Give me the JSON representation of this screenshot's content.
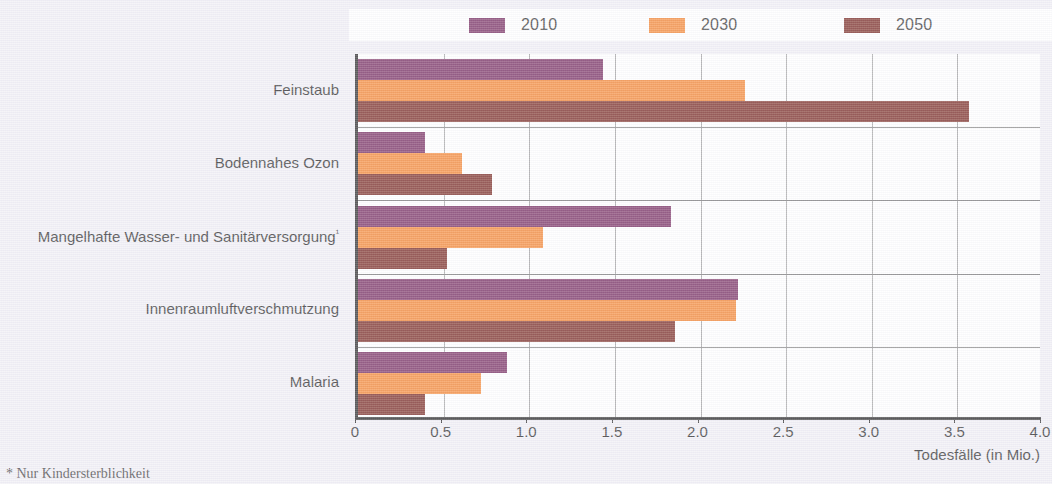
{
  "legend": {
    "items": [
      {
        "label": "2010",
        "color": "#6B1A52"
      },
      {
        "label": "2030",
        "color": "#F47B20"
      },
      {
        "label": "2050",
        "color": "#6E1810"
      }
    ]
  },
  "axis": {
    "ticks": [
      "0",
      "0.5",
      "1.0",
      "1.5",
      "2.0",
      "2.5",
      "3.0",
      "3.5",
      "4.0"
    ],
    "xlabel": "Todesfälle (in Mio.)"
  },
  "footnote": {
    "text": "* Nur Kindersterblichkeit"
  },
  "chart_data": {
    "type": "bar",
    "orientation": "horizontal",
    "title": "",
    "xlabel": "Todesfälle (in Mio.)",
    "ylabel": "",
    "xlim": [
      0,
      4.0
    ],
    "xticks": [
      0,
      0.5,
      1.0,
      1.5,
      2.0,
      2.5,
      3.0,
      3.5,
      4.0
    ],
    "grid": "vertical",
    "legend_position": "top",
    "categories": [
      "Feinstaub",
      "Bodennahes Ozon",
      "Mangelhafte Wasser- und Sanitärversorgung¹",
      "Innenraumluftverschmutzung",
      "Malaria"
    ],
    "series": [
      {
        "name": "2010",
        "color": "#6B1A52",
        "values": [
          1.43,
          0.39,
          1.83,
          2.22,
          0.87
        ]
      },
      {
        "name": "2030",
        "color": "#F47B20",
        "values": [
          2.26,
          0.61,
          1.08,
          2.21,
          0.72
        ]
      },
      {
        "name": "2050",
        "color": "#6E1810",
        "values": [
          3.57,
          0.78,
          0.52,
          1.85,
          0.39
        ]
      }
    ]
  }
}
